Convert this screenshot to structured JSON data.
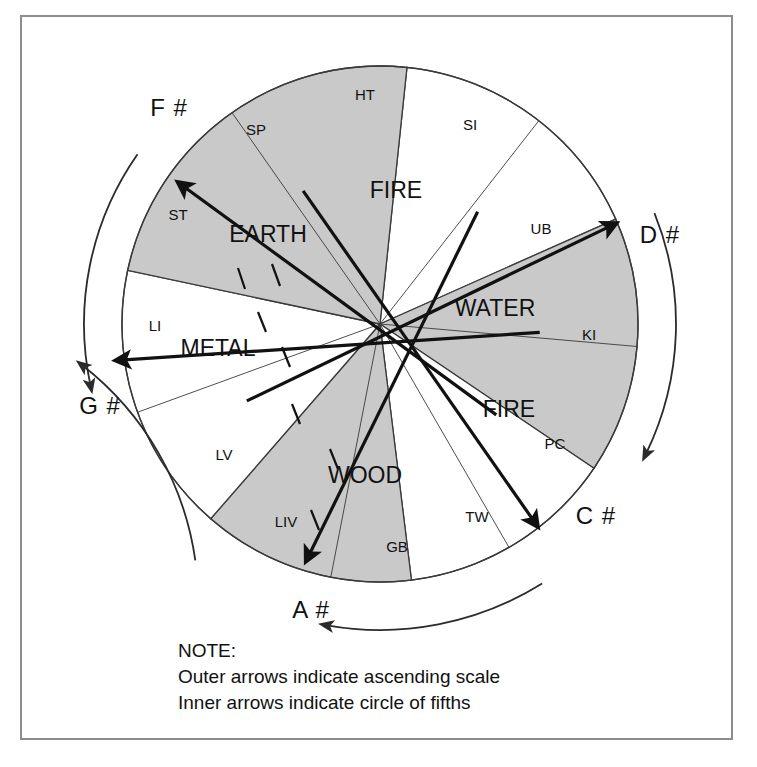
{
  "figure": {
    "center": {
      "x": 380,
      "y": 324
    },
    "radius": 258,
    "colors": {
      "shaded_sector": "#c9c9c9",
      "white_sector": "#ffffff",
      "outline": "#3a3a3a",
      "frame": "#8d8d8d",
      "text": "#111111"
    }
  },
  "elements": [
    {
      "name": "FIRE",
      "shaded": false,
      "label_x": 396,
      "label_y": 192,
      "start_deg": -84,
      "end_deg": -24,
      "sub_divider_deg": -52,
      "organs": [
        {
          "code": "HT",
          "x": 365,
          "y": 96
        },
        {
          "code": "SI",
          "x": 470,
          "y": 126
        }
      ]
    },
    {
      "name": "WATER",
      "shaded": true,
      "label_x": 495,
      "label_y": 310,
      "start_deg": -24,
      "end_deg": 34,
      "sub_divider_deg": 5,
      "organs": [
        {
          "code": "UB",
          "x": 541,
          "y": 230
        },
        {
          "code": "KI",
          "x": 589,
          "y": 336
        }
      ]
    },
    {
      "name": "FIRE",
      "shaded": false,
      "label_x": 509,
      "label_y": 411,
      "start_deg": 34,
      "end_deg": 83,
      "sub_divider_deg": 60,
      "organs": [
        {
          "code": "PC",
          "x": 555,
          "y": 445
        },
        {
          "code": "TW",
          "x": 477,
          "y": 518
        }
      ]
    },
    {
      "name": "WOOD",
      "shaded": true,
      "label_x": 365,
      "label_y": 477,
      "start_deg": 83,
      "end_deg": 131,
      "sub_divider_deg": 101,
      "organs": [
        {
          "code": "GB",
          "x": 397,
          "y": 548
        },
        {
          "code": "LIV",
          "x": 286,
          "y": 523
        }
      ]
    },
    {
      "name": "METAL",
      "shaded": false,
      "label_x": 218,
      "label_y": 350,
      "start_deg": 131,
      "end_deg": 192,
      "sub_divider_deg": 160,
      "organs": [
        {
          "code": "LV",
          "x": 224,
          "y": 456
        },
        {
          "code": "LI",
          "x": 155,
          "y": 327
        }
      ]
    },
    {
      "name": "EARTH",
      "shaded": true,
      "label_x": 268,
      "label_y": 236,
      "start_deg": 192,
      "end_deg": 276,
      "sub_divider_deg": 235,
      "organs": [
        {
          "code": "ST",
          "x": 178,
          "y": 216
        },
        {
          "code": "SP",
          "x": 256,
          "y": 131
        }
      ]
    }
  ],
  "note_labels": [
    {
      "text": "F #",
      "x": 169,
      "y": 110
    },
    {
      "text": "D #",
      "x": 660,
      "y": 237
    },
    {
      "text": "G #",
      "x": 100,
      "y": 408
    },
    {
      "text": "C #",
      "x": 596,
      "y": 518
    },
    {
      "text": "A #",
      "x": 311,
      "y": 612
    }
  ],
  "inner_arrows": [
    {
      "name": "earth-arrow",
      "from_deg": 38,
      "to_deg": 215,
      "length": 238
    },
    {
      "name": "water-arrow",
      "from_deg": 150,
      "to_deg": -23,
      "length": 248
    },
    {
      "name": "fire-arrow",
      "from_deg": 240,
      "to_deg": 52,
      "length": 248
    },
    {
      "name": "gsharp-arrow",
      "from_deg": 3,
      "to_deg": 172,
      "length": 258
    },
    {
      "name": "wood-arrow",
      "from_deg": -49,
      "to_deg": 107,
      "length": 240
    }
  ],
  "outer_arcs": [
    {
      "name": "outer-arc-upper-left",
      "start_deg": 215,
      "end_deg": 168,
      "radius": 296,
      "direction": "ccw"
    },
    {
      "name": "outer-arc-lower-left",
      "start_deg": 128,
      "end_deg": 172,
      "radius": 300,
      "direction": "ccw"
    },
    {
      "name": "outer-arc-bottom",
      "start_deg": 58,
      "end_deg": 100,
      "radius": 306,
      "direction": "cw"
    },
    {
      "name": "outer-arc-right",
      "start_deg": -22,
      "end_deg": 26,
      "radius": 296,
      "direction": "cw"
    }
  ],
  "note": {
    "heading": "NOTE:",
    "line1": "Outer arrows indicate ascending scale",
    "line2": "Inner arrows indicate circle of fifths"
  }
}
